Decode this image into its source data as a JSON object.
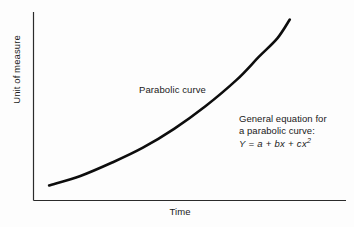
{
  "chart_data": {
    "type": "line",
    "title": "",
    "xlabel": "Time",
    "ylabel": "Unit of measure",
    "grid": false,
    "legend_position": "none",
    "axis_style": "open-left-bottom",
    "xlim": [
      0,
      100
    ],
    "ylim": [
      0,
      100
    ],
    "x_tick_labels": [],
    "y_tick_labels": [],
    "annotations": [
      {
        "name": "curve-label",
        "text": "Parabolic curve",
        "x": 42,
        "y": 63
      },
      {
        "name": "equation-note",
        "lines": [
          "General equation for",
          "a parabolic curve:"
        ],
        "formula_prefix": "Y = a + bx + cx",
        "formula_exponent": "2",
        "x": 68,
        "y": 40
      }
    ],
    "series": [
      {
        "name": "Parabolic curve",
        "color": "#0d0d0d",
        "x": [
          5,
          15,
          25,
          35,
          45,
          55,
          65,
          72,
          78,
          82
        ],
        "values": [
          8,
          13,
          20,
          28,
          38,
          50,
          64,
          76,
          86,
          96
        ]
      }
    ]
  },
  "axes": {
    "y_label": "Unit of measure",
    "x_label": "Time"
  },
  "annotation": {
    "curve_label": "Parabolic curve"
  },
  "equation": {
    "line1": "General equation for",
    "line2": "a parabolic curve:",
    "formula_prefix": "Y = a + bx + cx",
    "formula_exponent": "2"
  },
  "colors": {
    "curve": "#0d0d0d",
    "axis": "#2b2b2b",
    "text": "#1a1a1a",
    "background": "#fdfdfd"
  }
}
